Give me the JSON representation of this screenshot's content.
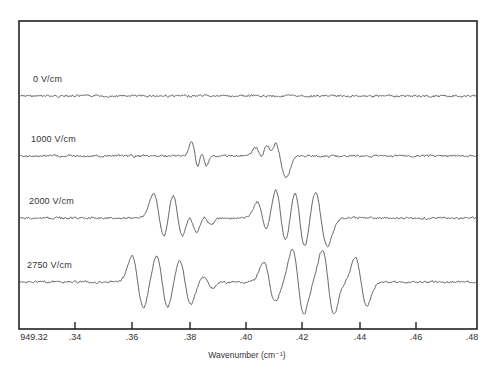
{
  "chart_data": {
    "type": "line",
    "title": "",
    "xlabel": "Wavenumber (cm⁻¹)",
    "ylabel": "",
    "xlim": [
      949.32,
      949.48
    ],
    "grid": false,
    "legend": "inline labels above each trace",
    "x_ticks": [
      949.32,
      949.34,
      949.36,
      949.38,
      949.4,
      949.42,
      949.44,
      949.46,
      949.48
    ],
    "x_tick_labels": [
      "949.32",
      ".34",
      ".36",
      ".38",
      ".40",
      ".42",
      ".44",
      ".46",
      ".48"
    ],
    "series": [
      {
        "name": "0 V/cm",
        "baseline_rank": 1,
        "lines": []
      },
      {
        "name": "1000 V/cm",
        "baseline_rank": 2,
        "lines": [
          {
            "center": 949.3815,
            "amp": 14,
            "width": 0.0012
          },
          {
            "center": 949.3845,
            "amp": 9,
            "width": 0.001
          },
          {
            "center": 949.404,
            "amp": 8,
            "width": 0.0014
          },
          {
            "center": 949.4075,
            "amp": 14,
            "width": 0.0014
          },
          {
            "center": 949.4105,
            "amp": 20,
            "width": 0.0015
          },
          {
            "center": 949.4125,
            "amp": 14,
            "width": 0.0015
          }
        ]
      },
      {
        "name": "2000 V/cm",
        "baseline_rank": 3,
        "lines": [
          {
            "center": 949.369,
            "amp": 24,
            "width": 0.002
          },
          {
            "center": 949.3755,
            "amp": 28,
            "width": 0.002
          },
          {
            "center": 949.3805,
            "amp": 16,
            "width": 0.0018
          },
          {
            "center": 949.3855,
            "amp": 6,
            "width": 0.0016
          },
          {
            "center": 949.405,
            "amp": 16,
            "width": 0.0018
          },
          {
            "center": 949.4115,
            "amp": 30,
            "width": 0.002
          },
          {
            "center": 949.418,
            "amp": 32,
            "width": 0.002
          },
          {
            "center": 949.4255,
            "amp": 28,
            "width": 0.0022
          }
        ]
      },
      {
        "name": "2750 V/cm",
        "baseline_rank": 4,
        "lines": [
          {
            "center": 949.3615,
            "amp": 26,
            "width": 0.002
          },
          {
            "center": 949.37,
            "amp": 26,
            "width": 0.002
          },
          {
            "center": 949.378,
            "amp": 22,
            "width": 0.002
          },
          {
            "center": 949.386,
            "amp": 6,
            "width": 0.0016
          },
          {
            "center": 949.4075,
            "amp": 20,
            "width": 0.002
          },
          {
            "center": 949.4175,
            "amp": 32,
            "width": 0.002
          },
          {
            "center": 949.428,
            "amp": 32,
            "width": 0.002
          },
          {
            "center": 949.4395,
            "amp": 24,
            "width": 0.002
          }
        ]
      }
    ]
  },
  "labels": {
    "series": [
      "0 V/cm",
      "1000 V/cm",
      "2000 V/cm",
      "2750 V/cm"
    ],
    "x_ticks": [
      "949.32",
      ".34",
      ".36",
      ".38",
      ".40",
      ".42",
      ".44",
      ".46",
      ".48"
    ],
    "xlabel": "Wavenumber (cm⁻¹)"
  },
  "layout": {
    "plot": {
      "left": 19,
      "right": 477,
      "top": 21,
      "bottom": 329
    },
    "baselines_y": [
      96,
      156,
      218,
      282
    ],
    "label_pos": [
      {
        "x": 33,
        "y": 80
      },
      {
        "x": 31,
        "y": 140
      },
      {
        "x": 29,
        "y": 202
      },
      {
        "x": 27,
        "y": 266
      }
    ],
    "tick_x": [
      19,
      75,
      132,
      190,
      246,
      302,
      360,
      416,
      475
    ],
    "line_color": "#555555",
    "frame_color": "#222222"
  }
}
